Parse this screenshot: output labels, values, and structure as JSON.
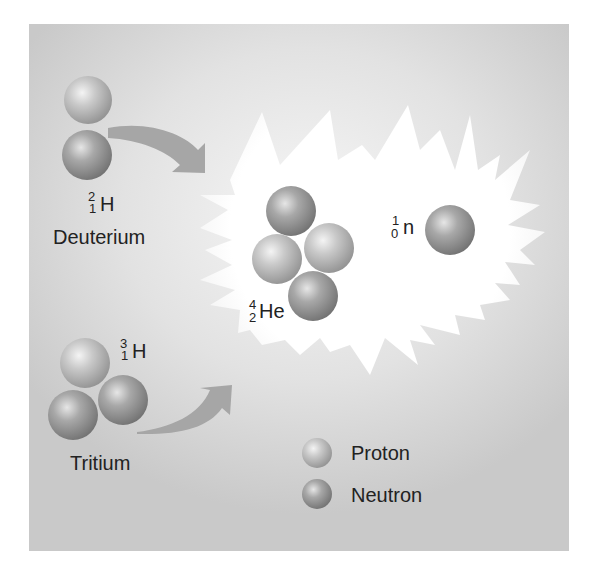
{
  "diagram": {
    "reactants": [
      {
        "name": "Deuterium",
        "symbol": "H",
        "mass_number": "2",
        "atomic_number": "1",
        "particles": [
          "proton",
          "neutron"
        ]
      },
      {
        "name": "Tritium",
        "symbol": "H",
        "mass_number": "3",
        "atomic_number": "1",
        "particles": [
          "proton",
          "neutron",
          "neutron"
        ]
      }
    ],
    "products": [
      {
        "symbol": "He",
        "mass_number": "4",
        "atomic_number": "2",
        "particles": [
          "neutron",
          "proton",
          "proton",
          "neutron"
        ]
      },
      {
        "symbol": "n",
        "mass_number": "1",
        "atomic_number": "0",
        "particles": [
          "neutron"
        ]
      }
    ],
    "legend": [
      {
        "label": "Proton",
        "type": "proton"
      },
      {
        "label": "Neutron",
        "type": "neutron"
      }
    ],
    "colors": {
      "background": "#d4d4d4",
      "burst": "#ffffff",
      "arrow": "#a8a8a8",
      "text": "#222222"
    }
  }
}
